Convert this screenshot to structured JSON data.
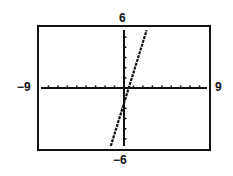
{
  "chart_data": {
    "type": "line",
    "title": "",
    "xlabel": "",
    "ylabel": "",
    "xlim": [
      -9,
      9
    ],
    "ylim": [
      -6,
      6
    ],
    "xscale": 1,
    "yscale": 1,
    "grid": false,
    "window_labels": {
      "xmin": "−9",
      "xmax": "9",
      "ymin": "−6",
      "ymax": "6"
    },
    "series": [
      {
        "name": "line",
        "equation": "y = 3x - 1.5",
        "slope": 3,
        "intercept": -1.5,
        "x": [
          -1.5,
          2.5
        ],
        "y": [
          -6,
          6
        ],
        "style": "dotted-thick"
      }
    ]
  },
  "colors": {
    "axis": "#111111",
    "frame": "#111111",
    "curve": "#111111",
    "background": "#ffffff"
  }
}
